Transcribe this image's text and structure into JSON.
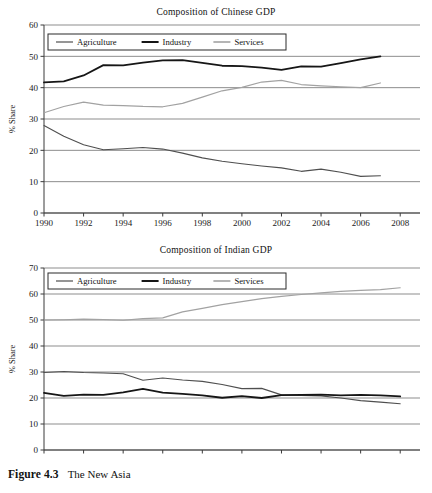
{
  "figure": {
    "caption_label": "Figure 4.3",
    "caption_text": "The New Asia"
  },
  "chart_data": [
    {
      "id": "china",
      "type": "line",
      "title": "Composition of Chinese GDP",
      "xlabel": "",
      "ylabel": "% Share",
      "xlim": [
        1990,
        2009
      ],
      "ylim": [
        0,
        60
      ],
      "ytick_step": 10,
      "yticks": [
        0,
        10,
        20,
        30,
        40,
        50,
        60
      ],
      "xticks": [
        1990,
        1992,
        1994,
        1996,
        1998,
        2000,
        2002,
        2004,
        2006,
        2008
      ],
      "grid": true,
      "legend_position": "top-left-inside",
      "x": [
        1990,
        1991,
        1992,
        1993,
        1994,
        1995,
        1996,
        1997,
        1998,
        1999,
        2000,
        2001,
        2002,
        2003,
        2004,
        2005,
        2006,
        2007
      ],
      "series": [
        {
          "name": "Agriculture",
          "color": "#4f4f4f",
          "values": [
            27.9,
            24.5,
            21.8,
            20.2,
            20.5,
            20.9,
            20.4,
            19.1,
            17.6,
            16.5,
            15.7,
            15.0,
            14.4,
            13.3,
            14.0,
            13.0,
            11.7,
            11.9
          ]
        },
        {
          "name": "Industry",
          "color": "#161616",
          "values": [
            41.7,
            42.0,
            43.9,
            47.2,
            47.1,
            48.0,
            48.7,
            48.8,
            47.9,
            47.0,
            46.9,
            46.4,
            45.7,
            46.8,
            46.7,
            47.8,
            49.0,
            50.0
          ]
        },
        {
          "name": "Services",
          "color": "#a2a2a2",
          "values": [
            32.0,
            34.0,
            35.4,
            34.4,
            34.3,
            34.0,
            33.9,
            35.0,
            37.0,
            39.0,
            40.1,
            41.8,
            42.3,
            41.0,
            40.6,
            40.3,
            40.0,
            41.5
          ]
        }
      ]
    },
    {
      "id": "india",
      "type": "line",
      "title": "Composition of Indian GDP",
      "xlabel": "",
      "ylabel": "% Share",
      "xlim": [
        1990,
        2009
      ],
      "ylim": [
        0,
        70
      ],
      "ytick_step": 10,
      "yticks": [
        0,
        10,
        20,
        30,
        40,
        50,
        60,
        70
      ],
      "xticks": [
        1990,
        1992,
        1994,
        1996,
        1998,
        2000,
        2002,
        2004,
        2006,
        2008
      ],
      "grid": true,
      "legend_position": "top-left-inside",
      "x": [
        1990,
        1991,
        1992,
        1993,
        1994,
        1995,
        1996,
        1997,
        1998,
        1999,
        2000,
        2001,
        2002,
        2003,
        2004,
        2005,
        2006,
        2007,
        2008
      ],
      "series": [
        {
          "name": "Agriculture",
          "color": "#4f4f4f",
          "values": [
            29.8,
            30.2,
            29.8,
            29.6,
            29.3,
            26.8,
            27.7,
            26.9,
            26.4,
            25.2,
            23.6,
            23.7,
            21.2,
            21.0,
            20.8,
            20.0,
            19.0,
            18.4,
            17.8
          ]
        },
        {
          "name": "Industry",
          "color": "#161616",
          "values": [
            22.0,
            20.8,
            21.3,
            21.2,
            22.2,
            23.5,
            22.1,
            21.6,
            21.0,
            20.1,
            20.7,
            20.0,
            21.1,
            21.2,
            21.3,
            21.0,
            21.2,
            21.0,
            20.6
          ]
        },
        {
          "name": "Services",
          "color": "#a2a2a2",
          "values": [
            50.0,
            50.1,
            50.3,
            50.2,
            49.9,
            50.5,
            50.8,
            53.1,
            54.5,
            55.9,
            57.1,
            58.2,
            59.1,
            59.8,
            60.4,
            61.0,
            61.4,
            61.7,
            62.4
          ]
        }
      ]
    }
  ]
}
